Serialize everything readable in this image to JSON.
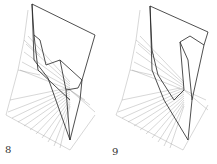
{
  "figures": [
    {
      "label": "8"
    },
    {
      "label": "9"
    }
  ],
  "colors": {
    "stroke_dark": "#222222",
    "stroke_light": "#8a8a8a",
    "background": "#ffffff"
  }
}
